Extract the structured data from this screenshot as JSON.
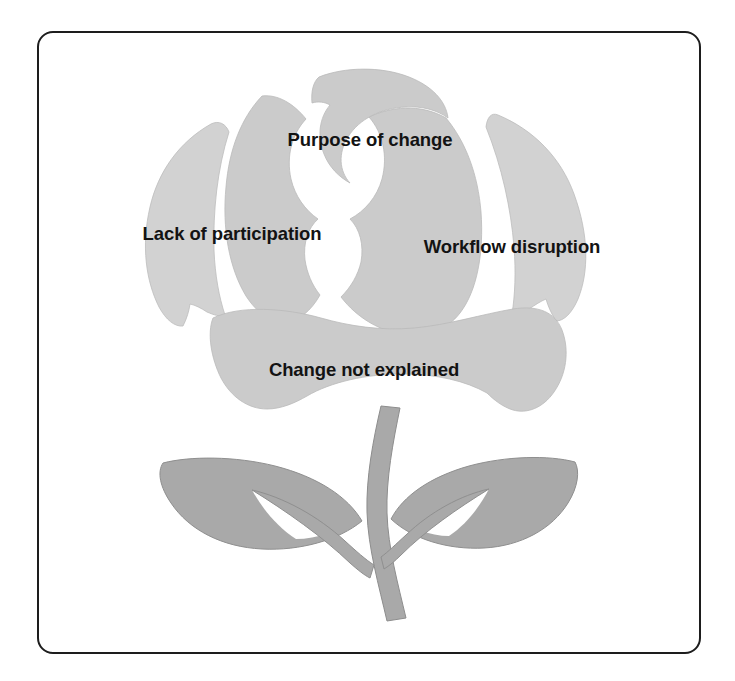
{
  "diagram": {
    "type": "rose-petal-diagram",
    "title_text": "",
    "shape_name": "rose flower with stem and two leaves",
    "colors": {
      "frame_border": "#1d1d1d",
      "page_background": "#ffffff",
      "petal_fill": "#d2d2d2",
      "petal_fill_alt": "#cbcbcb",
      "leaf_fill": "#a9a9a9",
      "stem_fill": "#a9a9a9",
      "separator": "#ffffff",
      "label_text": "#131313"
    },
    "labels": [
      {
        "id": "purpose-of-change",
        "text": "Purpose of change",
        "position": "top-center",
        "x": 370,
        "y": 146
      },
      {
        "id": "lack-of-participation",
        "text": "Lack of participation",
        "position": "left",
        "x": 232,
        "y": 240
      },
      {
        "id": "workflow-disruption",
        "text": "Workflow disruption",
        "position": "right",
        "x": 512,
        "y": 253
      },
      {
        "id": "change-not-explained",
        "text": "Change not explained",
        "position": "bottom-center",
        "x": 364,
        "y": 376
      }
    ],
    "parts": [
      {
        "id": "petal-outer-left",
        "name": "outer-left-petal"
      },
      {
        "id": "petal-outer-right",
        "name": "outer-right-petal"
      },
      {
        "id": "petal-inner-left",
        "name": "inner-left-petal"
      },
      {
        "id": "petal-inner-right",
        "name": "inner-right-petal"
      },
      {
        "id": "petal-top",
        "name": "top-petal"
      },
      {
        "id": "petal-bottom",
        "name": "bottom-petal"
      },
      {
        "id": "stem",
        "name": "stem"
      },
      {
        "id": "leaf-left",
        "name": "left-leaf"
      },
      {
        "id": "leaf-right",
        "name": "right-leaf"
      }
    ]
  }
}
